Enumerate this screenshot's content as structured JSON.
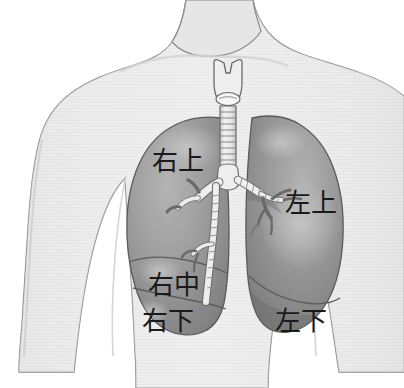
{
  "image": {
    "title": "Lung lobes anatomical diagram",
    "subject": "human upper torso with lungs, trachea and bronchial tree",
    "width": 404,
    "height": 388,
    "background_color": "#ffffff"
  },
  "labels": {
    "right_upper": "右上",
    "left_upper": "左上",
    "right_middle": "右中",
    "right_lower": "右下",
    "left_lower": "左下"
  },
  "anatomy": {
    "larynx": "larynx-thyroid-cartilage",
    "trachea": "trachea",
    "carina": "carina",
    "right_main_bronchus": "right-main-bronchus",
    "left_main_bronchus": "left-main-bronchus",
    "right_lung": "right-lung",
    "left_lung": "left-lung",
    "horizontal_fissure": "horizontal-fissure",
    "oblique_fissure": "oblique-fissure",
    "torso": "torso-silhouette",
    "neck": "neck",
    "left_arm": "left-arm",
    "right_arm": "right-arm"
  },
  "colors": {
    "body_fill": "#ececec",
    "body_outline": "#7d7d7d",
    "lung_fill": "#9d9d9d",
    "lung_shadow": "#828282",
    "lung_highlight": "#b9b9b9",
    "lung_outline": "#5e5e5e",
    "airway_fill": "#e8e8e8",
    "airway_outline": "#6a6a6a",
    "label_color": "#1a1a1a"
  }
}
